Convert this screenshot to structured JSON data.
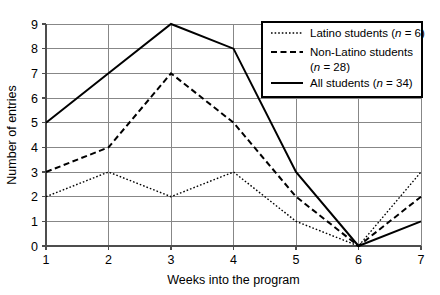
{
  "chart_data": {
    "type": "line",
    "title": "",
    "xlabel": "Weeks into the program",
    "ylabel": "Number of entries",
    "x": [
      1,
      2,
      3,
      4,
      5,
      6,
      7
    ],
    "categories": [
      "1",
      "2",
      "3",
      "4",
      "5",
      "6",
      "7"
    ],
    "xlim": [
      1,
      7
    ],
    "ylim": [
      0,
      9
    ],
    "xticks": [
      "1",
      "2",
      "3",
      "4",
      "5",
      "6",
      "7"
    ],
    "yticks": [
      "0",
      "1",
      "2",
      "3",
      "4",
      "5",
      "6",
      "7",
      "8",
      "9"
    ],
    "grid": "both",
    "legend_position": "top-right",
    "series": [
      {
        "name": "Latino students (n = 6)",
        "label_main": "Latino students (",
        "label_italic": "n",
        "label_tail": " = 6)",
        "style": "dotted",
        "color": "#000000",
        "values": [
          2,
          3,
          2,
          3,
          1,
          0,
          3
        ]
      },
      {
        "name": "Non-Latino students (n = 28)",
        "label_main": "Non-Latino students",
        "label_italic": "n",
        "label_tail": " = 28)",
        "label_line2_head": "(",
        "style": "dashed",
        "color": "#000000",
        "values": [
          3,
          4,
          7,
          5,
          2,
          0,
          2
        ]
      },
      {
        "name": "All students (n = 34)",
        "label_main": "All students (",
        "label_italic": "n",
        "label_tail": " = 34)",
        "style": "solid",
        "color": "#000000",
        "values": [
          5,
          7,
          9,
          8,
          3,
          0,
          1
        ]
      }
    ]
  },
  "colors": {
    "grid": "#878787",
    "axis": "#4d4d4d",
    "line": "#000000",
    "legend_border": "#000000",
    "background": "#ffffff"
  }
}
